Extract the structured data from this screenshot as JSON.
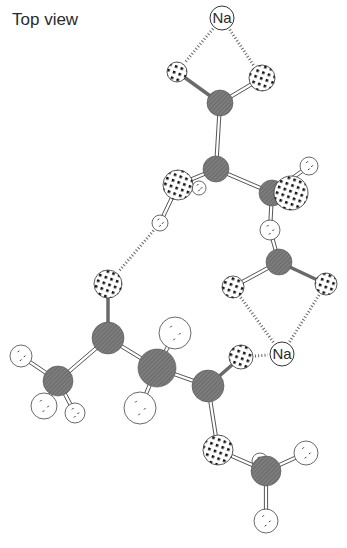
{
  "title": "Top view",
  "colors": {
    "carbon": "#7a7a7a",
    "oxygen_fill": "#ffffff",
    "oxygen_dot": "#111111",
    "hydrogen_fill": "#ffffff",
    "sodium_fill": "#ffffff",
    "bond": "#555555",
    "hbond": "#666666"
  },
  "atoms": [
    {
      "id": "na1",
      "el": "Na",
      "x": 222,
      "y": 18,
      "r": 12,
      "label": "Na"
    },
    {
      "id": "o1",
      "el": "O",
      "x": 177,
      "y": 72,
      "r": 10
    },
    {
      "id": "o2",
      "el": "O",
      "x": 262,
      "y": 78,
      "r": 13
    },
    {
      "id": "c1",
      "el": "C",
      "x": 220,
      "y": 103,
      "r": 13
    },
    {
      "id": "c2",
      "el": "C",
      "x": 216,
      "y": 169,
      "r": 13
    },
    {
      "id": "h1",
      "el": "H",
      "x": 199,
      "y": 188,
      "r": 7
    },
    {
      "id": "o3",
      "el": "O",
      "x": 178,
      "y": 185,
      "r": 15
    },
    {
      "id": "h2",
      "el": "H",
      "x": 160,
      "y": 223,
      "r": 8
    },
    {
      "id": "c3",
      "el": "C",
      "x": 272,
      "y": 193,
      "r": 13
    },
    {
      "id": "o4",
      "el": "O",
      "x": 291,
      "y": 193,
      "r": 17
    },
    {
      "id": "h3",
      "el": "H",
      "x": 309,
      "y": 166,
      "r": 9
    },
    {
      "id": "h4",
      "el": "H",
      "x": 270,
      "y": 230,
      "r": 10
    },
    {
      "id": "c4",
      "el": "C",
      "x": 279,
      "y": 262,
      "r": 13
    },
    {
      "id": "o5",
      "el": "O",
      "x": 233,
      "y": 287,
      "r": 11
    },
    {
      "id": "o6",
      "el": "O",
      "x": 326,
      "y": 284,
      "r": 11
    },
    {
      "id": "na2",
      "el": "Na",
      "x": 282,
      "y": 354,
      "r": 12,
      "label": "Na"
    },
    {
      "id": "o7",
      "el": "O",
      "x": 108,
      "y": 284,
      "r": 14
    },
    {
      "id": "c5",
      "el": "C",
      "x": 108,
      "y": 338,
      "r": 16
    },
    {
      "id": "c6",
      "el": "C",
      "x": 58,
      "y": 381,
      "r": 15
    },
    {
      "id": "h5",
      "el": "H",
      "x": 21,
      "y": 356,
      "r": 11
    },
    {
      "id": "h6",
      "el": "H",
      "x": 44,
      "y": 406,
      "r": 13
    },
    {
      "id": "h7",
      "el": "H",
      "x": 75,
      "y": 413,
      "r": 10
    },
    {
      "id": "h8",
      "el": "H",
      "x": 175,
      "y": 333,
      "r": 16
    },
    {
      "id": "c7",
      "el": "C",
      "x": 157,
      "y": 368,
      "r": 19
    },
    {
      "id": "h9",
      "el": "H",
      "x": 140,
      "y": 408,
      "r": 16
    },
    {
      "id": "o8",
      "el": "O",
      "x": 241,
      "y": 357,
      "r": 12
    },
    {
      "id": "c8",
      "el": "C",
      "x": 208,
      "y": 386,
      "r": 16
    },
    {
      "id": "o9",
      "el": "O",
      "x": 218,
      "y": 450,
      "r": 15
    },
    {
      "id": "h10",
      "el": "H",
      "x": 260,
      "y": 461,
      "r": 8
    },
    {
      "id": "c9",
      "el": "C",
      "x": 266,
      "y": 471,
      "r": 15
    },
    {
      "id": "h11",
      "el": "H",
      "x": 306,
      "y": 453,
      "r": 12
    },
    {
      "id": "h12",
      "el": "H",
      "x": 266,
      "y": 521,
      "r": 12
    }
  ],
  "bonds": [
    [
      "o1",
      "c1",
      "single"
    ],
    [
      "o2",
      "c1",
      "double"
    ],
    [
      "c1",
      "c2",
      "double"
    ],
    [
      "c2",
      "o3",
      "double"
    ],
    [
      "c2",
      "c3",
      "double"
    ],
    [
      "o3",
      "h2",
      "double"
    ],
    [
      "c3",
      "h3",
      "double"
    ],
    [
      "c3",
      "h4",
      "double"
    ],
    [
      "h4",
      "c4",
      "double"
    ],
    [
      "c4",
      "o5",
      "double"
    ],
    [
      "c4",
      "o6",
      "single"
    ],
    [
      "o7",
      "c5",
      "single"
    ],
    [
      "c5",
      "c6",
      "double"
    ],
    [
      "c6",
      "h5",
      "double"
    ],
    [
      "c6",
      "h6",
      "double"
    ],
    [
      "c6",
      "h7",
      "double"
    ],
    [
      "c5",
      "c7",
      "double"
    ],
    [
      "c7",
      "h8",
      "double"
    ],
    [
      "c7",
      "h9",
      "double"
    ],
    [
      "c7",
      "c8",
      "double"
    ],
    [
      "c8",
      "o8",
      "single"
    ],
    [
      "c8",
      "o9",
      "double"
    ],
    [
      "o9",
      "c9",
      "double"
    ],
    [
      "c9",
      "h11",
      "double"
    ],
    [
      "c9",
      "h12",
      "double"
    ]
  ],
  "hbonds": [
    [
      "na1",
      "o1"
    ],
    [
      "na1",
      "o2"
    ],
    [
      "h2",
      "o7"
    ],
    [
      "o5",
      "na2"
    ],
    [
      "o6",
      "na2"
    ],
    [
      "o8",
      "na2"
    ]
  ]
}
